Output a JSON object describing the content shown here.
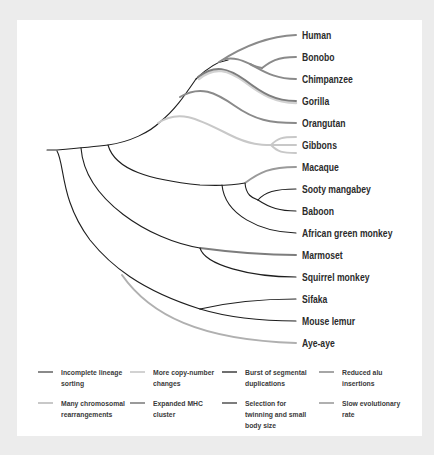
{
  "diagram": {
    "type": "phylogenetic-tree",
    "taxa": [
      {
        "name": "Human",
        "y": 35
      },
      {
        "name": "Bonobo",
        "y": 57
      },
      {
        "name": "Chimpanzee",
        "y": 79
      },
      {
        "name": "Gorilla",
        "y": 101
      },
      {
        "name": "Orangutan",
        "y": 123
      },
      {
        "name": "Gibbons",
        "y": 145
      },
      {
        "name": "Macaque",
        "y": 167
      },
      {
        "name": "Sooty mangabey",
        "y": 189
      },
      {
        "name": "Baboon",
        "y": 211
      },
      {
        "name": "African green monkey",
        "y": 233
      },
      {
        "name": "Marmoset",
        "y": 255
      },
      {
        "name": "Squirrel monkey",
        "y": 277
      },
      {
        "name": "Sifaka",
        "y": 299
      },
      {
        "name": "Mouse lemur",
        "y": 321
      },
      {
        "name": "Aye-aye",
        "y": 343
      }
    ],
    "colors": {
      "base_branch": "#1e1e1e",
      "incomplete_lineage_sorting": "#8a8a8a",
      "more_copy_number_changes": "#d2d2d2",
      "burst_segmental_duplications": "#6f6f6f",
      "reduced_alu_insertions": "#a6a6a6",
      "many_chromosomal_rearrangements": "#c8c8c8",
      "expanded_mhc_cluster": "#9a9a9a",
      "selection_twinning_small_body": "#7d7d7d",
      "slow_evolutionary_rate": "#b0b0b0"
    }
  },
  "legend": {
    "items": [
      {
        "label": "Incomplete lineage sorting",
        "color": "#8a8a8a"
      },
      {
        "label": "More copy-number changes",
        "color": "#d2d2d2"
      },
      {
        "label": "Burst of segmental duplications",
        "color": "#6f6f6f"
      },
      {
        "label": "Reduced alu insertions",
        "color": "#a6a6a6"
      },
      {
        "label": "Many chromosomal rearrangements",
        "color": "#c8c8c8"
      },
      {
        "label": "Expanded MHC cluster",
        "color": "#9a9a9a"
      },
      {
        "label": "Selection for twinning and small body size",
        "color": "#7d7d7d"
      },
      {
        "label": "Slow evolutionary rate",
        "color": "#b0b0b0"
      }
    ]
  }
}
